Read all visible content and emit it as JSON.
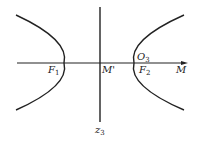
{
  "diagram": {
    "type": "hyperbola-with-axes",
    "stroke_color": "#222222",
    "labels": {
      "F1": {
        "base": "F",
        "sub": "1"
      },
      "F2": {
        "base": "F",
        "sub": "2"
      },
      "O3": {
        "base": "O",
        "sub": "3"
      },
      "M_prime": {
        "base": "M'"
      },
      "M": {
        "base": "M"
      },
      "z3": {
        "base": "z",
        "sub": "3"
      }
    }
  }
}
